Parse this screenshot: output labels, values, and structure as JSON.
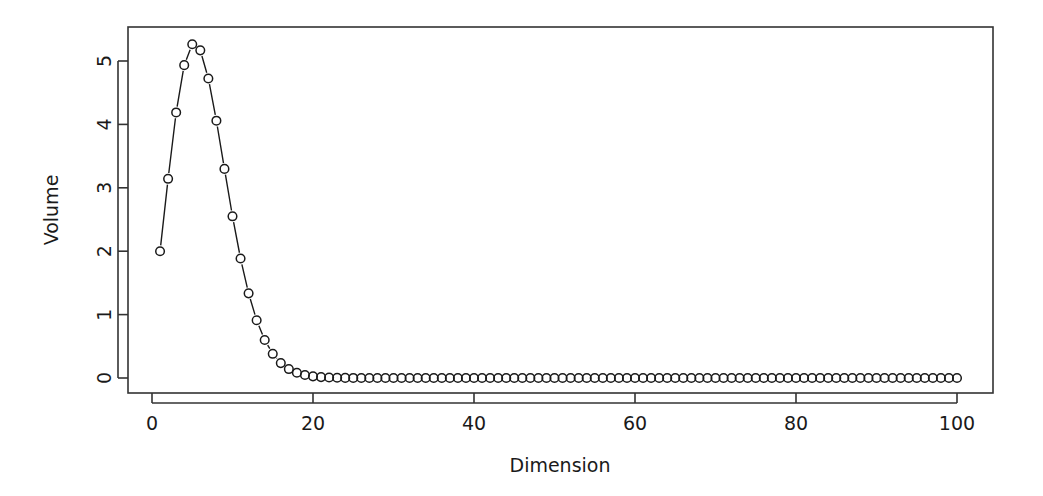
{
  "chart_data": {
    "type": "line",
    "title": "",
    "subtitle": "",
    "xlabel": "Dimension",
    "ylabel": "Volume",
    "xlim": [
      0,
      101
    ],
    "ylim": [
      0,
      5.5
    ],
    "grid": false,
    "legend": null,
    "marker": "open-circle",
    "line_style": "solid-segments-between-markers",
    "xticks": [
      0,
      20,
      40,
      60,
      80,
      100
    ],
    "xticklabels": [
      "0",
      "20",
      "40",
      "60",
      "80",
      "100"
    ],
    "yticks": [
      0,
      1,
      2,
      3,
      4,
      5
    ],
    "yticklabels": [
      "0",
      "1",
      "2",
      "3",
      "4",
      "5"
    ],
    "x": [
      1,
      2,
      3,
      4,
      5,
      6,
      7,
      8,
      9,
      10,
      11,
      12,
      13,
      14,
      15,
      16,
      17,
      18,
      19,
      20,
      21,
      22,
      23,
      24,
      25,
      26,
      27,
      28,
      29,
      30,
      31,
      32,
      33,
      34,
      35,
      36,
      37,
      38,
      39,
      40,
      41,
      42,
      43,
      44,
      45,
      46,
      47,
      48,
      49,
      50,
      51,
      52,
      53,
      54,
      55,
      56,
      57,
      58,
      59,
      60,
      61,
      62,
      63,
      64,
      65,
      66,
      67,
      68,
      69,
      70,
      71,
      72,
      73,
      74,
      75,
      76,
      77,
      78,
      79,
      80,
      81,
      82,
      83,
      84,
      85,
      86,
      87,
      88,
      89,
      90,
      91,
      92,
      93,
      94,
      95,
      96,
      97,
      98,
      99,
      100
    ],
    "values": [
      2.0,
      3.1416,
      4.1888,
      4.9348,
      5.2638,
      5.1677,
      4.7248,
      4.0587,
      3.2985,
      2.5502,
      1.8841,
      1.3353,
      0.9106,
      0.5993,
      0.3814,
      0.2353,
      0.1409,
      0.0822,
      0.0466,
      0.0258,
      0.014,
      0.0074,
      0.0038,
      0.0019,
      0.001,
      0.0005,
      0.0002,
      0.0001,
      0.0001,
      0.0,
      0.0,
      0.0,
      0.0,
      0.0,
      0.0,
      0.0,
      0.0,
      0.0,
      0.0,
      0.0,
      0.0,
      0.0,
      0.0,
      0.0,
      0.0,
      0.0,
      0.0,
      0.0,
      0.0,
      0.0,
      0.0,
      0.0,
      0.0,
      0.0,
      0.0,
      0.0,
      0.0,
      0.0,
      0.0,
      0.0,
      0.0,
      0.0,
      0.0,
      0.0,
      0.0,
      0.0,
      0.0,
      0.0,
      0.0,
      0.0,
      0.0,
      0.0,
      0.0,
      0.0,
      0.0,
      0.0,
      0.0,
      0.0,
      0.0,
      0.0,
      0.0,
      0.0,
      0.0,
      0.0,
      0.0,
      0.0,
      0.0,
      0.0,
      0.0,
      0.0,
      0.0,
      0.0,
      0.0,
      0.0,
      0.0,
      0.0,
      0.0,
      0.0,
      0.0,
      0.0
    ]
  },
  "colors": {
    "background": "#ffffff",
    "foreground": "#1a1a1a",
    "axis": "#333333"
  },
  "geometry": {
    "plot_left": 128,
    "plot_right": 993,
    "plot_top": 27,
    "plot_bottom": 393,
    "x_origin_px": 152,
    "x_px_per_unit": 8.05,
    "y_zero_px": 378,
    "y_px_per_unit": 63.4,
    "marker_radius": 4.3
  }
}
